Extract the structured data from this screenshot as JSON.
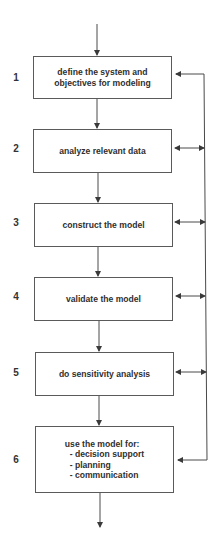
{
  "diagram": {
    "type": "flowchart",
    "colors": {
      "line": "#4a4a4a",
      "box_border": "#5a5a5a",
      "text": "#2f2f2f"
    },
    "steps": [
      {
        "number": "1",
        "lines": [
          "define the system and",
          "objectives for modeling"
        ]
      },
      {
        "number": "2",
        "lines": [
          "analyze relevant data"
        ]
      },
      {
        "number": "3",
        "lines": [
          "construct the model"
        ]
      },
      {
        "number": "4",
        "lines": [
          "validate the model"
        ]
      },
      {
        "number": "5",
        "lines": [
          "do sensitivity analysis"
        ]
      },
      {
        "number": "6",
        "lines": [
          "use the model for:",
          "  - decision support",
          "  - planning",
          "  - communication"
        ]
      }
    ],
    "feedback": {
      "description": "feedback loop on right side connecting steps 2-5 (bidirectional) back to steps 1 and 6",
      "bidirectional_steps": [
        "2",
        "3",
        "4",
        "5"
      ],
      "targets": [
        "1",
        "6"
      ]
    }
  }
}
